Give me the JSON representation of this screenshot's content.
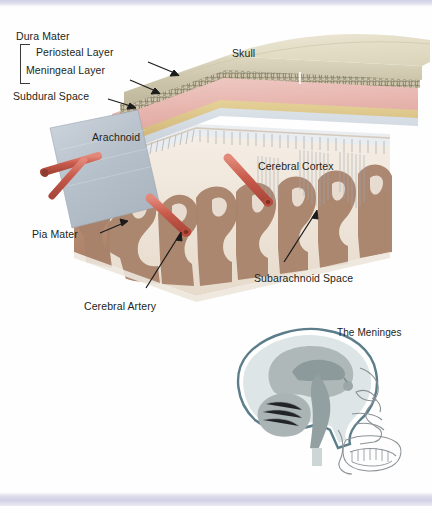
{
  "figure": {
    "title": "The Meninges"
  },
  "labels": {
    "dura_mater": "Dura Mater",
    "periosteal_layer": "Periosteal Layer",
    "meningeal_layer": "Meningeal Layer",
    "subdural_space": "Subdural Space",
    "arachnoid": "Arachnoid",
    "skull": "Skull",
    "cerebral_cortex": "Cerebral Cortex",
    "pia_mater": "Pia Mater",
    "cerebral_artery": "Cerebral Artery",
    "subarachnoid_space": "Subarachnoid Space",
    "inset_title": "The Meninges"
  },
  "colors": {
    "skull_outer": "#e6e2ce",
    "skull_face": "#ded8c0",
    "diploe": "#8f8871",
    "dura_periosteal": "#e9b8b3",
    "dura_meningeal": "#d9c083",
    "subdural": "#cfd6dd",
    "arachnoid": "#b9c3cd",
    "cortex_gray": "#a8826a",
    "white_matter": "#efe6dc",
    "artery_red": "#c8584a",
    "artery_light": "#dd7d6c",
    "trabeculae": "#9aa3ae",
    "inset_brain": "#9aa6a8",
    "inset_csf": "#dbe3e3",
    "inset_line": "#5c7d8a",
    "text": "#231f20",
    "band": "#cfcfe6"
  },
  "inset": {
    "parts": [
      "skull outline",
      "facial profile",
      "teeth",
      "cerebrum",
      "cerebellum",
      "brainstem",
      "corpus callosum",
      "meningeal envelope"
    ]
  }
}
